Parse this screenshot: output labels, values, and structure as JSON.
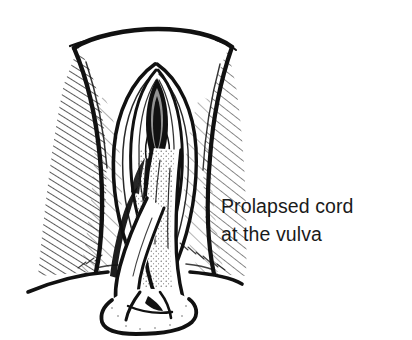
{
  "figure": {
    "kind": "medical-line-illustration",
    "background_color": "#ffffff",
    "ink_color": "#111111",
    "caption_color": "#1a1a1a",
    "caption": {
      "line1": "Prolapsed cord",
      "line2": "at the vulva"
    },
    "parts": {
      "mons_pubis_arch": "mons-pubis-arch",
      "left_groin_fold": "left-groin-fold",
      "right_groin_fold": "right-groin-fold",
      "labia_majora": "labia-majora",
      "labia_minora": "labia-minora",
      "vaginal_introitus": "vaginal-introitus",
      "prolapsed_cord": "prolapsed-umbilical-cord",
      "cord_loop": "cord-loop",
      "perineum_line": "perineum-line",
      "hatching": "cross-hatch-shading"
    }
  }
}
